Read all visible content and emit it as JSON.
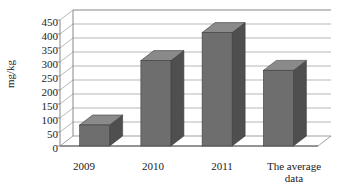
{
  "chart_data": {
    "type": "bar",
    "title": "",
    "subtitle": "",
    "xlabel": "",
    "ylabel": "mg/kg",
    "categories": [
      "2009",
      "2010",
      "2011",
      "The average data"
    ],
    "values": [
      75,
      305,
      405,
      270
    ],
    "series": [
      {
        "name": "mg/kg",
        "values": [
          75,
          305,
          405,
          270
        ]
      }
    ],
    "ylim": [
      0,
      450
    ],
    "ytick_values": [
      0,
      50,
      100,
      150,
      200,
      250,
      300,
      350,
      400,
      450
    ],
    "ytick_labels": [
      "0",
      "50",
      "100",
      "150",
      "200",
      "250",
      "300",
      "350",
      "400",
      "450"
    ],
    "grid": true,
    "grid_axis": "y",
    "legend": false,
    "legend_position": "none",
    "style": "3d-column",
    "bar_color": "#6e6e6e",
    "bar_side_color": "#4f4f4f",
    "bar_top_color": "#8a8a8a",
    "grid_color": "#9a9a9a",
    "axis_color": "#7a7a7a",
    "plot_background": "#ffffff",
    "text_color": "#1a1a1a"
  },
  "axis": {
    "y_title": "mg/kg"
  },
  "ticks": {
    "y": [
      "450",
      "400",
      "350",
      "300",
      "250",
      "200",
      "150",
      "100",
      "50",
      "0"
    ]
  },
  "categories": {
    "c0_line1": "2009",
    "c0_line2": "",
    "c1_line1": "2010",
    "c1_line2": "",
    "c2_line1": "2011",
    "c2_line2": "",
    "c3_line1": "The average",
    "c3_line2": "data"
  }
}
